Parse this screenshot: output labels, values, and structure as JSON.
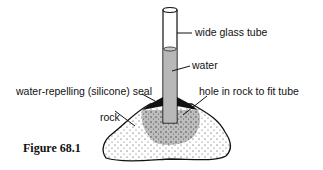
{
  "figure": {
    "caption": "Figure 68.1",
    "labels": {
      "tube": "wide glass tube",
      "water": "water",
      "seal": "water-repelling (silicone) seal",
      "hole": "hole in rock to fit tube",
      "rock": "rock"
    }
  }
}
